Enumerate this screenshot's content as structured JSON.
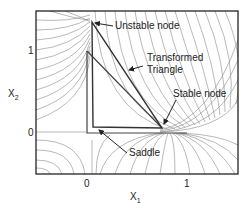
{
  "figure": {
    "type": "phase-portrait",
    "xlabel": "X",
    "xlabel_sub": "1",
    "ylabel": "X",
    "ylabel_sub": "2",
    "x_ticks": [
      "0",
      "1"
    ],
    "y_ticks": [
      "1",
      "0"
    ],
    "colors": {
      "frame": "#111111",
      "trajectories": "#7a7a7a",
      "triangle": "#444444",
      "text": "#222222"
    }
  },
  "annotations": {
    "unstable_node": "Unstable node",
    "transformed_triangle_line1": "Transformed",
    "transformed_triangle_line2": "Triangle",
    "stable_node": "Stable node",
    "saddle": "Saddle"
  },
  "points": {
    "unstable_node": [
      0.05,
      1.35
    ],
    "saddle": [
      0.07,
      0.07
    ],
    "stable_node": [
      0.75,
      0.05
    ]
  }
}
